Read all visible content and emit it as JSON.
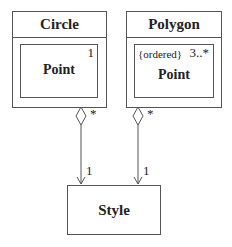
{
  "classes": {
    "circle": {
      "name": "Circle",
      "part": {
        "name": "Point",
        "multiplicity": "1"
      }
    },
    "polygon": {
      "name": "Polygon",
      "part": {
        "name": "Point",
        "constraint": "{ordered}",
        "multiplicity": "3..*"
      }
    },
    "style": {
      "name": "Style"
    }
  },
  "associations": [
    {
      "from": "Circle",
      "to": "Style",
      "source_multiplicity": "*",
      "target_multiplicity": "1",
      "kind": "aggregation"
    },
    {
      "from": "Polygon",
      "to": "Style",
      "source_multiplicity": "*",
      "target_multiplicity": "1",
      "kind": "aggregation"
    }
  ]
}
